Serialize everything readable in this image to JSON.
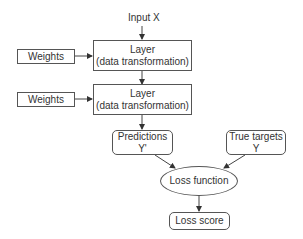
{
  "diagram": {
    "input_label": "Input X",
    "layers": [
      {
        "title": "Layer",
        "subtitle": "(data transformation)",
        "weights_label": "Weights"
      },
      {
        "title": "Layer",
        "subtitle": "(data transformation)",
        "weights_label": "Weights"
      }
    ],
    "predictions": {
      "title": "Predictions",
      "subtitle": "Y'"
    },
    "true_targets": {
      "title": "True targets",
      "subtitle": "Y"
    },
    "loss_function": {
      "label": "Loss function"
    },
    "loss_score": {
      "label": "Loss score"
    },
    "edges": [
      {
        "from": "Input X",
        "to": "Layer 1"
      },
      {
        "from": "Weights 1",
        "to": "Layer 1"
      },
      {
        "from": "Layer 1",
        "to": "Layer 2"
      },
      {
        "from": "Weights 2",
        "to": "Layer 2"
      },
      {
        "from": "Layer 2",
        "to": "Predictions Y'"
      },
      {
        "from": "Predictions Y'",
        "to": "Loss function"
      },
      {
        "from": "True targets Y",
        "to": "Loss function"
      },
      {
        "from": "Loss function",
        "to": "Loss score"
      }
    ],
    "colors": {
      "stroke": "#555555",
      "text": "#333333",
      "background": "#ffffff"
    }
  }
}
